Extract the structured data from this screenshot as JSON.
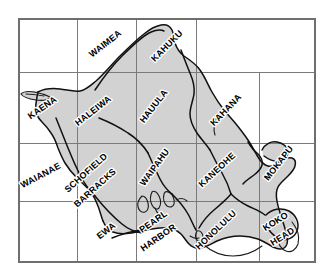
{
  "map": {
    "title": "Oahu",
    "region": "Hawaii",
    "background_color": "#ffffff",
    "island_fill_color": "#d2d2d2",
    "coast_color": "#111111",
    "grid_color": "#7a7a7a",
    "label_color": "#000000",
    "label_halo_color": "#ffffff",
    "frame": {
      "x": 19,
      "y": 19,
      "width": 296,
      "height": 243
    },
    "grid": {
      "visible": true,
      "vertical_lines": [
        77,
        136,
        196,
        259
      ],
      "horizontal_lines": [
        72,
        143,
        201
      ]
    },
    "labels": [
      {
        "id": "waimea",
        "text": "WAIMEA",
        "x": 107,
        "y": 46,
        "rotation": -38
      },
      {
        "id": "kahuku",
        "text": "KAHUKU",
        "x": 169,
        "y": 48,
        "rotation": -45
      },
      {
        "id": "kaena",
        "text": "KAENA",
        "x": 44,
        "y": 110,
        "rotation": -35
      },
      {
        "id": "haleiwa",
        "text": "HALEIWA",
        "x": 95,
        "y": 113,
        "rotation": -38
      },
      {
        "id": "hauula",
        "text": "HAUULA",
        "x": 156,
        "y": 108,
        "rotation": -52
      },
      {
        "id": "kahana",
        "text": "KAHANA",
        "x": 228,
        "y": 112,
        "rotation": -46
      },
      {
        "id": "waianae",
        "text": "WAIANAE",
        "x": 29,
        "y": 175,
        "rotation": -28
      },
      {
        "id": "schofield",
        "text": "SCHOFIELD",
        "x": 83,
        "y": 172,
        "rotation": -42
      },
      {
        "id": "barracks",
        "text": "BARRACKS",
        "x": 92,
        "y": 186,
        "rotation": -42
      },
      {
        "id": "waipahu",
        "text": "WAIPAHU",
        "x": 154,
        "y": 166,
        "rotation": -54
      },
      {
        "id": "kaneohe",
        "text": "KANEOHE",
        "x": 213,
        "y": 168,
        "rotation": -43
      },
      {
        "id": "mokapu",
        "text": "MOKAPU",
        "x": 276,
        "y": 162,
        "rotation": -52
      },
      {
        "id": "ewa",
        "text": "EWA",
        "x": 106,
        "y": 232,
        "rotation": -38
      },
      {
        "id": "pearl",
        "text": "PEARL",
        "x": 155,
        "y": 222,
        "rotation": -35
      },
      {
        "id": "harbor",
        "text": "HARBOR",
        "x": 155,
        "y": 238,
        "rotation": -35
      },
      {
        "id": "honolulu",
        "text": "HONOLULU",
        "x": 213,
        "y": 228,
        "rotation": -44
      },
      {
        "id": "koko",
        "text": "KOKO",
        "x": 277,
        "y": 222,
        "rotation": -32
      },
      {
        "id": "head",
        "text": "HEAD",
        "x": 281,
        "y": 237,
        "rotation": -32
      }
    ]
  }
}
